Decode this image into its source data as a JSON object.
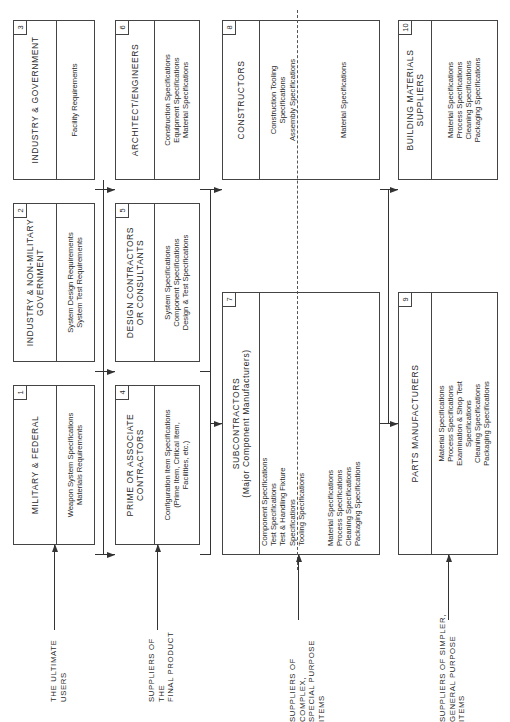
{
  "diagram": {
    "type": "flowchart",
    "orientation": "rotated-90-ccw",
    "boxes": [
      {
        "id": 1,
        "number": "1",
        "title": "MILITARY & FEDERAL",
        "items": "Weapon System Specifications\nMaterials Requirements"
      },
      {
        "id": 2,
        "number": "2",
        "title": "INDUSTRY & NON-MILITARY\nGOVERNMENT",
        "items": "System Design Requirements\nSystem  Test  Requirements"
      },
      {
        "id": 3,
        "number": "3",
        "title": "INDUSTRY & GOVERNMENT",
        "items": "Facility Requirements"
      },
      {
        "id": 4,
        "number": "4",
        "title": "PRIME OR ASSOCIATE\nCONTRACTORS",
        "items": "Configuration Item Specifications\n(Prime Item, Critical Item,\nFacilities, etc.)"
      },
      {
        "id": 5,
        "number": "5",
        "title": "DESIGN CONTRACTORS\nOR CONSULTANTS",
        "items": "System Specifications\nComponent Specifications\nDesign & Test Specifications"
      },
      {
        "id": 6,
        "number": "6",
        "title": "ARCHITECT/ENGINEERS",
        "items": "Construction Specifications\nEquipment Specifications\nMaterial Specifications"
      },
      {
        "id": 7,
        "number": "7",
        "title": "SUBCONTRACTORS\n(Major Component Manufacturers)",
        "items_upper": "Component Specifications\nTest Specifications\nTest & Handling Fixture\nSpecifications\nTooling Specifications",
        "items_lower": "Material Specifications\nProcess Specifications\nCleaning Specifications\nPackaging Specifications"
      },
      {
        "id": 8,
        "number": "8",
        "title": "CONSTRUCTORS",
        "items_upper": "Construction Tooling\nSpecifications\nAssembly Specifications",
        "items_lower": "Material Specifications"
      },
      {
        "id": 9,
        "number": "9",
        "title": "PARTS MANUFACTURERS",
        "items": "Material Specifications\nProcess Specifications\nExamination & Shop Test\nSpecifications\nCleaning Specifications\nPackaging Specifications"
      },
      {
        "id": 10,
        "number": "10",
        "title": "BUILDING MATERIALS\nSUPPLIERS",
        "items": "Material Specifications\nProcess Specifications\nCleaning Specifications\nPackaging Specifications"
      }
    ],
    "row_labels": [
      {
        "label": "THE ULTIMATE USERS"
      },
      {
        "label": "SUPPLIERS OF THE\nFINAL PRODUCT"
      },
      {
        "label": "SUPPLIERS OF COMPLEX,\nSPECIAL PURPOSE ITEMS"
      },
      {
        "label": "SUPPLIERS OF SIMPLER,\nGENERAL PURPOSE ITEMS"
      }
    ],
    "edges": [
      [
        "1",
        "4"
      ],
      [
        "2",
        "5"
      ],
      [
        "3",
        "6"
      ],
      [
        "4",
        "7"
      ],
      [
        "5",
        "7"
      ],
      [
        "6",
        "8"
      ],
      [
        "7",
        "9"
      ],
      [
        "8",
        "10"
      ]
    ]
  }
}
